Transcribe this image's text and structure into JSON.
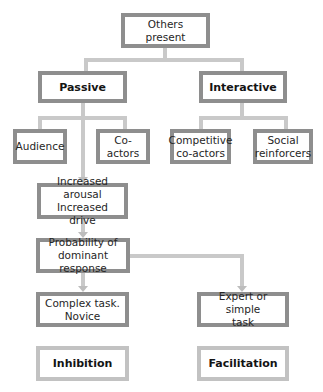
{
  "diagram": {
    "type": "flowchart",
    "colors": {
      "box_border_dark": "#8e8e8e",
      "box_border_light": "#c2c2c2",
      "connector": "#c9c9c9",
      "background": "#ffffff"
    },
    "nodes": {
      "root": {
        "label": "Others present"
      },
      "passive": {
        "label": "Passive"
      },
      "interactive": {
        "label": "Interactive"
      },
      "audience": {
        "label": "Audience"
      },
      "co_actors": {
        "label": "Co-actors"
      },
      "competitive": {
        "line1": "Competitive",
        "line2": "co-actors"
      },
      "social": {
        "line1": "Social",
        "line2": "reinforcers"
      },
      "arousal": {
        "line1": "Increased arousal",
        "line2": "Increased drive"
      },
      "probability": {
        "line1": "Probability of",
        "line2": "dominant response"
      },
      "complex": {
        "line1": "Complex task.",
        "line2": "Novice"
      },
      "expert": {
        "line1": "Expert or simple",
        "line2": "task"
      },
      "inhibition": {
        "label": "Inhibition"
      },
      "facilitation": {
        "label": "Facilitation"
      }
    },
    "edges": [
      {
        "from": "Others present",
        "to": "Passive"
      },
      {
        "from": "Others present",
        "to": "Interactive"
      },
      {
        "from": "Passive",
        "to": "Audience"
      },
      {
        "from": "Passive",
        "to": "Co-actors"
      },
      {
        "from": "Passive",
        "to": "Increased arousal / Increased drive",
        "arrow": true
      },
      {
        "from": "Interactive",
        "to": "Competitive co-actors"
      },
      {
        "from": "Interactive",
        "to": "Social reinforcers"
      },
      {
        "from": "Increased arousal / Increased drive",
        "to": "Probability of dominant response",
        "arrow": true
      },
      {
        "from": "Probability of dominant response",
        "to": "Complex task. Novice",
        "arrow": true
      },
      {
        "from": "Probability of dominant response",
        "to": "Expert or simple task",
        "arrow": true
      }
    ]
  }
}
